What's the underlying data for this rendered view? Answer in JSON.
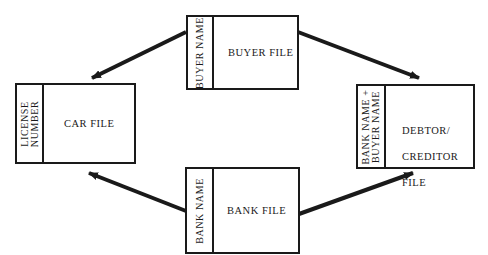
{
  "diagram": {
    "files": [
      {
        "id": "buyer",
        "title": "BUYER FILE",
        "key": "BUYER NAME"
      },
      {
        "id": "car",
        "title": "CAR FILE",
        "key_line1": "LICENSE",
        "key_line2": "NUMBER"
      },
      {
        "id": "debtor",
        "title_line1": "DEBTOR/",
        "title_line2": "CREDITOR",
        "title_line3": "FILE",
        "key_line1": "BANK NAME +",
        "key_line2": "BUYER NAME"
      },
      {
        "id": "bank",
        "title": "BANK FILE",
        "key": "BANK NAME"
      }
    ],
    "arrows": [
      {
        "from": "buyer",
        "to": "car"
      },
      {
        "from": "buyer",
        "to": "debtor"
      },
      {
        "from": "bank",
        "to": "car"
      },
      {
        "from": "bank",
        "to": "debtor"
      }
    ],
    "colors": {
      "ink": "#1a1a1a",
      "background": "#ffffff"
    }
  }
}
